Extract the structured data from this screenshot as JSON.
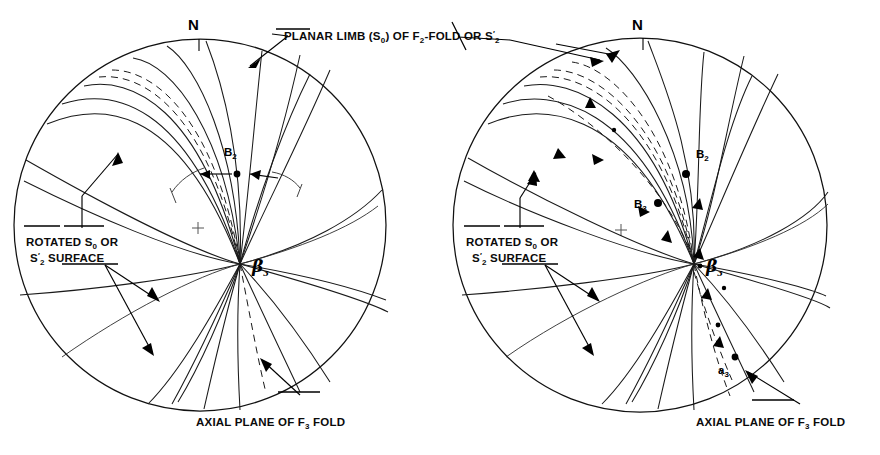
{
  "figure": {
    "panel_count": 2,
    "background_color": "#ffffff",
    "line_color": "#1a1a1a"
  },
  "labels": {
    "north": "N",
    "planar_limb": {
      "text": "PLANAR LIMB (S₀) OF F₂-FOLD OR S′₂",
      "parts": [
        "PLANAR LIMB (S",
        "0",
        ") OF F",
        "2",
        "-FOLD OR S",
        "2"
      ]
    },
    "rotated_surface_line1": "ROTATED S₀ OR",
    "rotated_surface_line2": "S′₂  SURFACE",
    "axial_plane": "AXIAL PLANE OF F₃ FOLD",
    "b2": "B₂",
    "b3": "B₃",
    "a3": "a₃",
    "beta3": "β₃"
  },
  "panels": [
    {
      "id": "left",
      "name": "left-stereonet",
      "center": [
        200,
        225
      ],
      "radius": 186,
      "north_tick": true,
      "center_cross": [
        198,
        228
      ],
      "beta_point": [
        240,
        264
      ],
      "point_markers": [
        {
          "label": "B₂",
          "x": 236,
          "y": 171,
          "filled": true
        }
      ],
      "callouts": [
        "PLANAR LIMB (S₀) OF F₂-FOLD OR S′₂",
        "ROTATED S₀ OR S′₂  SURFACE",
        "AXIAL PLANE OF F₃ FOLD"
      ],
      "great_circle_count": 14,
      "dashed_circle_count": 3
    },
    {
      "id": "right",
      "name": "right-stereonet",
      "center": [
        640,
        225
      ],
      "radius": 187,
      "north_tick": true,
      "center_cross": [
        621,
        230
      ],
      "beta_point": [
        694,
        264
      ],
      "point_markers": [
        {
          "label": "B₂",
          "x": 686,
          "y": 172,
          "filled": true
        },
        {
          "label": "B₃",
          "x": 657,
          "y": 202,
          "filled": true
        },
        {
          "label": "a₃",
          "x": 735,
          "y": 359,
          "filled": true
        }
      ],
      "callouts": [
        "ROTATED S₀ OR S′₂  SURFACE",
        "AXIAL PLANE OF F₃ FOLD"
      ],
      "great_circle_count": 14,
      "dashed_circle_count": 4,
      "trajectory_dots": 4
    }
  ]
}
